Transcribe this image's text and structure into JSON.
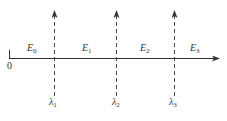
{
  "diagram": {
    "origin_label": "0",
    "regions": [
      {
        "symbol": "E",
        "sub": "0"
      },
      {
        "symbol": "E",
        "sub": "1"
      },
      {
        "symbol": "E",
        "sub": "2"
      },
      {
        "symbol": "E",
        "sub": "3"
      }
    ],
    "boundaries": [
      {
        "symbol": "λ",
        "sub": "1"
      },
      {
        "symbol": "λ",
        "sub": "2"
      },
      {
        "symbol": "λ",
        "sub": "3"
      }
    ],
    "colors": {
      "line": "#333333",
      "background": "#ffffff"
    }
  }
}
